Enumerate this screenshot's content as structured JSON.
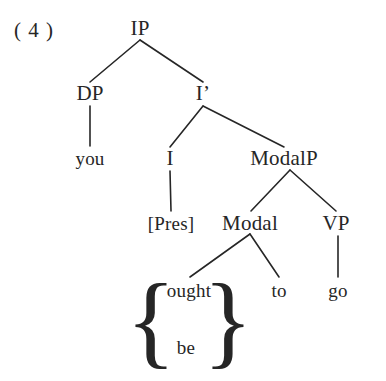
{
  "figure": {
    "example_number": "( 4 )",
    "background_color": "#ffffff",
    "ink_color": "#262626"
  },
  "tree": {
    "nodes": [
      {
        "id": "IP",
        "label": "IP",
        "x": 140,
        "y": 28,
        "kind": "node"
      },
      {
        "id": "DP",
        "label": "DP",
        "x": 90,
        "y": 93,
        "kind": "node"
      },
      {
        "id": "Ibar",
        "label": "I’",
        "x": 203,
        "y": 93,
        "kind": "node"
      },
      {
        "id": "you",
        "label": "you",
        "x": 90,
        "y": 158,
        "kind": "leaf"
      },
      {
        "id": "I",
        "label": "I",
        "x": 170,
        "y": 158,
        "kind": "node"
      },
      {
        "id": "ModalP",
        "label": "ModalP",
        "x": 284,
        "y": 158,
        "kind": "node"
      },
      {
        "id": "Pres",
        "label": "[Pres]",
        "x": 171,
        "y": 223,
        "kind": "leaf"
      },
      {
        "id": "Modal",
        "label": "Modal",
        "x": 250,
        "y": 223,
        "kind": "node"
      },
      {
        "id": "VP",
        "label": "VP",
        "x": 336,
        "y": 223,
        "kind": "node"
      },
      {
        "id": "ought",
        "label": "ought",
        "x": 189,
        "y": 290,
        "kind": "leaf"
      },
      {
        "id": "be",
        "label": "be",
        "x": 186,
        "y": 347,
        "kind": "leaf"
      },
      {
        "id": "to",
        "label": "to",
        "x": 279,
        "y": 290,
        "kind": "leaf"
      },
      {
        "id": "go",
        "label": "go",
        "x": 338,
        "y": 290,
        "kind": "leaf"
      }
    ],
    "edges": [
      {
        "from": "IP",
        "to": "DP",
        "x1": 140,
        "y1": 40,
        "x2": 90,
        "y2": 82
      },
      {
        "from": "IP",
        "to": "Ibar",
        "x1": 140,
        "y1": 40,
        "x2": 203,
        "y2": 82
      },
      {
        "from": "DP",
        "to": "you",
        "x1": 90,
        "y1": 106,
        "x2": 90,
        "y2": 146
      },
      {
        "from": "Ibar",
        "to": "I",
        "x1": 203,
        "y1": 106,
        "x2": 170,
        "y2": 147
      },
      {
        "from": "Ibar",
        "to": "ModalP",
        "x1": 203,
        "y1": 106,
        "x2": 284,
        "y2": 147
      },
      {
        "from": "I",
        "to": "Pres",
        "x1": 170,
        "y1": 171,
        "x2": 171,
        "y2": 211
      },
      {
        "from": "ModalP",
        "to": "Modal",
        "x1": 290,
        "y1": 170,
        "x2": 251,
        "y2": 211
      },
      {
        "from": "ModalP",
        "to": "VP",
        "x1": 290,
        "y1": 170,
        "x2": 336,
        "y2": 211
      },
      {
        "from": "Modal",
        "to": "ought",
        "x1": 250,
        "y1": 234,
        "x2": 190,
        "y2": 277
      },
      {
        "from": "Modal",
        "to": "to",
        "x1": 250,
        "y1": 234,
        "x2": 279,
        "y2": 277
      },
      {
        "from": "VP",
        "to": "go",
        "x1": 338,
        "y1": 236,
        "x2": 338,
        "y2": 277
      }
    ],
    "braces": {
      "left": {
        "glyph": "{",
        "x": 151,
        "y": 320
      },
      "right": {
        "glyph": "}",
        "x": 228,
        "y": 320
      },
      "contains": [
        "ought",
        "be"
      ]
    }
  }
}
